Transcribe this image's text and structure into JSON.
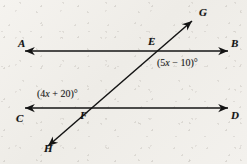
{
  "figure": {
    "kind": "geometry-diagram",
    "background_color": "#f1efeb",
    "ink_color": "#141414",
    "points": [
      {
        "id": "A",
        "label": "A",
        "x": 18,
        "y": 44,
        "role": "ray-end-left-upper"
      },
      {
        "id": "B",
        "label": "B",
        "x": 231,
        "y": 44,
        "role": "ray-end-right-upper"
      },
      {
        "id": "C",
        "label": "C",
        "x": 16,
        "y": 113,
        "role": "ray-end-left-lower"
      },
      {
        "id": "D",
        "label": "D",
        "x": 231,
        "y": 110,
        "role": "ray-end-right-lower"
      },
      {
        "id": "E",
        "label": "E",
        "x": 148,
        "y": 38,
        "role": "intersection-upper"
      },
      {
        "id": "F",
        "label": "F",
        "x": 80,
        "y": 112,
        "role": "intersection-lower"
      },
      {
        "id": "G",
        "label": "G",
        "x": 199,
        "y": 8,
        "role": "ray-end-transversal-top"
      },
      {
        "id": "H",
        "label": "H",
        "x": 44,
        "y": 146,
        "role": "ray-end-transversal-bottom"
      }
    ],
    "lines": [
      {
        "id": "AB",
        "name": "line-ab",
        "x1": 25,
        "y1": 51,
        "x2": 228,
        "y2": 51
      },
      {
        "id": "CD",
        "name": "line-cd",
        "x1": 25,
        "y1": 108,
        "x2": 228,
        "y2": 108
      },
      {
        "id": "GH",
        "name": "transversal-gh",
        "x1": 48,
        "y1": 146,
        "x2": 192,
        "y2": 21
      }
    ],
    "angles": [
      {
        "id": "angle-at-e",
        "expression": "(5x − 10)°",
        "prefix": "(5",
        "variable": "x",
        "suffix": " − 10)°",
        "x": 157,
        "y": 58,
        "vertex": "E"
      },
      {
        "id": "angle-at-f",
        "expression": "(4x + 20)°",
        "prefix": "(4",
        "variable": "x",
        "suffix": " + 20)°",
        "x": 37,
        "y": 89,
        "vertex": "F"
      }
    ]
  }
}
